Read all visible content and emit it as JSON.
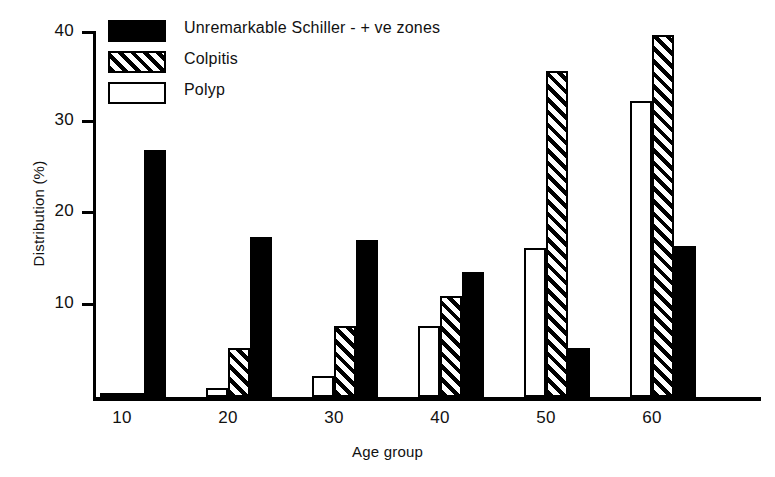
{
  "chart_data": {
    "type": "bar",
    "title": "",
    "xlabel": "Age group",
    "ylabel": "Distribution (%)",
    "categories": [
      "10",
      "20",
      "30",
      "40",
      "50",
      "60"
    ],
    "yticks": [
      "10",
      "20",
      "30",
      "40"
    ],
    "ylim": [
      0,
      40
    ],
    "grid": false,
    "legend_position": "top-left",
    "series": [
      {
        "name": "Polyp",
        "style": "open",
        "values": [
          0.2,
          1.0,
          2.3,
          7.8,
          16.3,
          32.3
        ]
      },
      {
        "name": "Colpitis",
        "style": "hatch",
        "values": [
          0.2,
          5.4,
          7.8,
          11.0,
          35.6,
          39.6
        ]
      },
      {
        "name": "Unremarkable Schiller - + ve zones",
        "style": "solid",
        "values": [
          27.0,
          17.5,
          17.2,
          13.7,
          5.4,
          16.5
        ]
      }
    ]
  },
  "legend": {
    "items": [
      {
        "label": "Unremarkable Schiller - + ve zones",
        "style": "solid"
      },
      {
        "label": "Colpitis",
        "style": "hatch"
      },
      {
        "label": "Polyp",
        "style": "open"
      }
    ]
  },
  "axes": {
    "y_title": "Distribution (%)",
    "x_title": "Age group",
    "y_tick_labels": [
      "40",
      "30",
      "20",
      "10"
    ],
    "x_tick_labels": [
      "10",
      "20",
      "30",
      "40",
      "50",
      "60"
    ]
  },
  "colors": {
    "ink": "#000000",
    "background": "#ffffff"
  }
}
